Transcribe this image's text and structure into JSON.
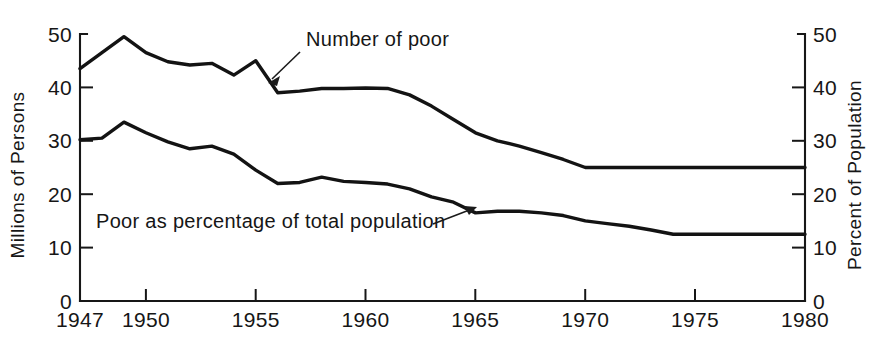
{
  "chart_data": {
    "type": "line",
    "title": "",
    "subtitle": "",
    "xlabel": "",
    "ylabel": "Millions of Persons",
    "y2label": "Percent of Population",
    "xlim": [
      1947,
      1980
    ],
    "ylim": [
      0,
      50
    ],
    "y2lim": [
      0,
      50
    ],
    "grid": false,
    "legend_position": "inline-annotations",
    "x_tick_labels": [
      "1947",
      "1950",
      "1955",
      "1960",
      "1965",
      "1970",
      "1975",
      "1980"
    ],
    "x_tick_values": [
      1947,
      1950,
      1955,
      1960,
      1965,
      1970,
      1975,
      1980
    ],
    "y_tick_labels": [
      "0",
      "10",
      "20",
      "30",
      "40",
      "50"
    ],
    "y_tick_values": [
      0,
      10,
      20,
      30,
      40,
      50
    ],
    "y2_tick_labels": [
      "0",
      "10",
      "20",
      "30",
      "40",
      "50"
    ],
    "y2_tick_values": [
      0,
      10,
      20,
      30,
      40,
      50
    ],
    "series": [
      {
        "name": "Number of poor",
        "axis": "left",
        "unit": "millions",
        "annotation": "Number of poor",
        "x": [
          1947,
          1948,
          1949,
          1950,
          1951,
          1952,
          1953,
          1954,
          1955,
          1956,
          1957,
          1958,
          1959,
          1960,
          1961,
          1962,
          1963,
          1964,
          1965,
          1966,
          1967,
          1968,
          1969,
          1970,
          1971,
          1972,
          1973,
          1974,
          1975,
          1976,
          1977,
          1978,
          1979,
          1980
        ],
        "values": [
          43.5,
          46.5,
          49.5,
          46.5,
          44.8,
          44.2,
          44.5,
          42.3,
          45.0,
          39.0,
          39.3,
          39.8,
          39.8,
          39.9,
          39.8,
          38.6,
          36.5,
          34.0,
          31.5,
          30.0,
          29.0,
          27.8,
          26.5,
          25.0,
          25.0,
          25.0,
          25.0,
          25.0,
          25.0,
          25.0,
          25.0,
          25.0,
          25.0,
          25.0
        ]
      },
      {
        "name": "Poor as percentage of total population",
        "axis": "right",
        "unit": "percent",
        "annotation": "Poor as percentage of total population",
        "x": [
          1947,
          1948,
          1949,
          1950,
          1951,
          1952,
          1953,
          1954,
          1955,
          1956,
          1957,
          1958,
          1959,
          1960,
          1961,
          1962,
          1963,
          1964,
          1965,
          1966,
          1967,
          1968,
          1969,
          1970,
          1971,
          1972,
          1973,
          1974,
          1975,
          1976,
          1977,
          1978,
          1979,
          1980
        ],
        "values": [
          30.2,
          30.5,
          33.5,
          31.5,
          29.8,
          28.5,
          29.0,
          27.5,
          24.5,
          22.0,
          22.2,
          23.2,
          22.4,
          22.2,
          21.9,
          21.0,
          19.5,
          18.5,
          16.5,
          16.8,
          16.8,
          16.5,
          16.0,
          15.0,
          14.5,
          14.0,
          13.3,
          12.5,
          12.5,
          12.5,
          12.5,
          12.5,
          12.5,
          12.5
        ]
      }
    ],
    "annotations": [
      {
        "name": "number-of-poor-annotation",
        "text": "Number of poor",
        "points_to_year": 1954,
        "points_to_value": 44.0
      },
      {
        "name": "poor-percentage-annotation",
        "text": "Poor as percentage of total population",
        "points_to_year": 1965,
        "points_to_value": 17.5
      }
    ],
    "colors": {
      "line": "#131313",
      "axis": "#171717",
      "text": "#161616",
      "background": "#ffffff"
    }
  }
}
